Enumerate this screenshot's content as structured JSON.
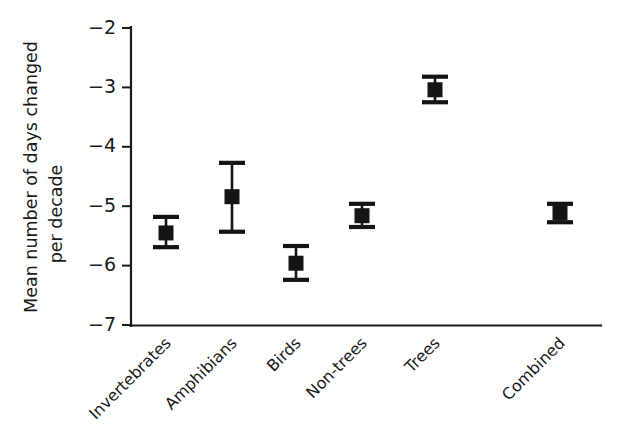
{
  "chart_data": {
    "type": "scatter",
    "title": "",
    "subtitle": "",
    "xlabel": "",
    "ylabel": "Mean number of days changed per decade",
    "ylabel_line1": "Mean number of days changed",
    "ylabel_line2": "per decade",
    "categories": [
      "Invertebrates",
      "Amphibians",
      "Birds",
      "Non-trees",
      "Trees",
      "Combined"
    ],
    "values": [
      -5.45,
      -4.84,
      -5.96,
      -5.16,
      -3.04,
      -5.11
    ],
    "error_low": [
      -5.69,
      -5.43,
      -6.24,
      -5.35,
      -3.25,
      -5.27
    ],
    "error_high": [
      -5.18,
      -4.27,
      -5.67,
      -4.96,
      -2.82,
      -4.96
    ],
    "ylim": [
      -7,
      -2
    ],
    "yticks": [
      -2,
      -3,
      -4,
      -5,
      -6,
      -7
    ],
    "ytick_labels": [
      "−2",
      "−3",
      "−4",
      "−5",
      "−6",
      "−7"
    ],
    "grid": false,
    "legend": "none",
    "marker": "filled-square",
    "marker_color": "#141414",
    "axis_color": "#1a1a1a",
    "background_color": "#ffffff",
    "xtick_label_rotation": -45
  },
  "figure": {
    "series_name": "Mean phenological shift",
    "point_count": 6
  }
}
